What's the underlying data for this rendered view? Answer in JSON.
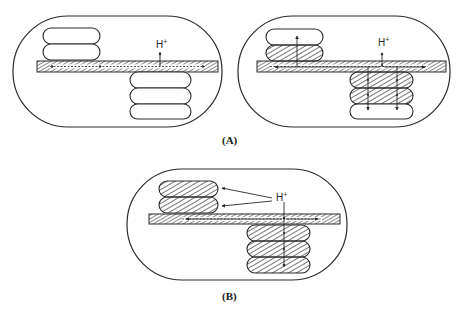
{
  "figure": {
    "panels": [
      {
        "id": "A-left",
        "group": "A",
        "ion_label": "H",
        "ion_charge": "+",
        "top_stack": {
          "discs": 2,
          "hatched": [
            false,
            false
          ]
        },
        "bottom_stack": {
          "discs": 3,
          "hatched": [
            false,
            false,
            false
          ]
        },
        "flow": "H+ enters membrane (stroma lamella); no flow into grana"
      },
      {
        "id": "A-right",
        "group": "A",
        "ion_label": "H",
        "ion_charge": "+",
        "top_stack": {
          "discs": 2,
          "hatched": [
            false,
            true
          ]
        },
        "bottom_stack": {
          "discs": 3,
          "hatched": [
            true,
            true,
            false
          ]
        },
        "flow": "H+ enters membrane and spreads into adjacent grana discs"
      },
      {
        "id": "B",
        "group": "B",
        "ion_label": "H",
        "ion_charge": "+",
        "top_stack": {
          "discs": 2,
          "hatched": [
            true,
            true
          ]
        },
        "bottom_stack": {
          "discs": 3,
          "hatched": [
            true,
            true,
            true
          ]
        },
        "flow": "H+ reaches all discs directly"
      }
    ],
    "labels": {
      "A": "(A)",
      "B": "(B)"
    },
    "colors": {
      "line": "#2a2a2a",
      "background": "#ffffff"
    }
  }
}
